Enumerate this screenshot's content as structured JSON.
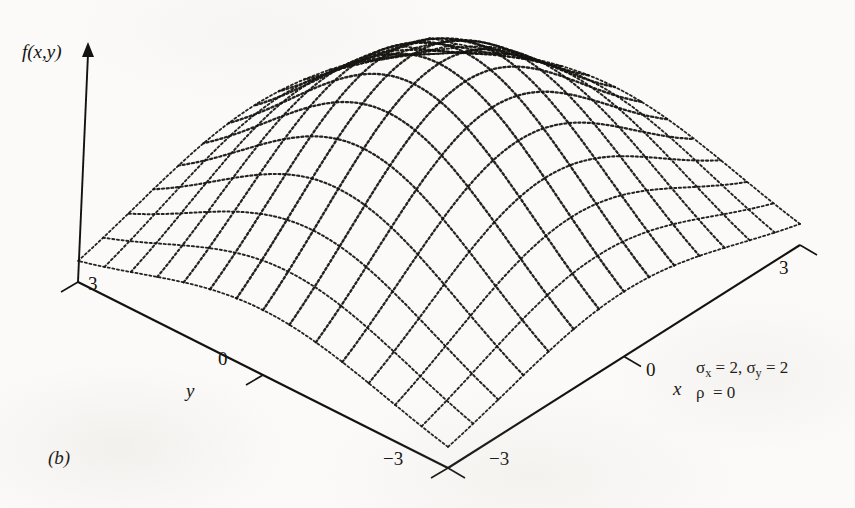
{
  "figure": {
    "caption": "(b)",
    "vertical_axis_label": "f(x,y)",
    "x_axis_label": "x",
    "y_axis_label": "y",
    "annotation_line1": "σx = 2, σy = 2",
    "annotation_line2": "ρ  = 0",
    "annotation_sigma_x_symbol": "σ",
    "annotation_sigma_x_sub": "x",
    "annotation_sigma_x_value": " = 2, ",
    "annotation_sigma_y_symbol": "σ",
    "annotation_sigma_y_sub": "y",
    "annotation_sigma_y_value": " = 2",
    "annotation_rho_symbol": "ρ",
    "annotation_rho_value": "  = 0",
    "ink_color": "#14120f",
    "paper_color": "#fbfaf8"
  },
  "ticks": {
    "y_3": "3",
    "y_0": "0",
    "y_neg3": "−3",
    "x_3": "3",
    "x_0": "0",
    "x_neg3": "−3"
  },
  "chart_data": {
    "type": "surface",
    "title": "",
    "subtitle": "",
    "function": "bivariate gaussian pdf",
    "xlabel": "x",
    "ylabel": "y",
    "zlabel": "f(x,y)",
    "xlim": [
      -3,
      3
    ],
    "ylim": [
      -3,
      3
    ],
    "xticks": [
      -3,
      0,
      3
    ],
    "yticks": [
      -3,
      0,
      3
    ],
    "grid": false,
    "legend": null,
    "mesh_divisions_x": 14,
    "mesh_divisions_y": 14,
    "line_style": "dotted",
    "parameters": {
      "sigma_x": 2,
      "sigma_y": 2,
      "rho": 0,
      "mu_x": 0,
      "mu_y": 0
    },
    "projection": {
      "origin_px": [
        78,
        282
      ],
      "right_corner_px": [
        800,
        245
      ],
      "front_corner_px": [
        448,
        468
      ],
      "back_corner_px": [
        432,
        62
      ],
      "z_axis_top_px": [
        88,
        42
      ],
      "peak_height_px": 200
    },
    "annotations": [
      {
        "text": "σx = 2, σy = 2",
        "position_px": [
          696,
          357
        ]
      },
      {
        "text": "ρ = 0",
        "position_px": [
          696,
          380
        ]
      },
      {
        "text": "(b)",
        "position_px": [
          48,
          448
        ]
      }
    ]
  }
}
